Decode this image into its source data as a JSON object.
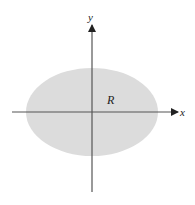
{
  "diagram": {
    "type": "region-in-plane",
    "axes": {
      "x_label": "x",
      "y_label": "y",
      "color": "#555555",
      "origin": {
        "x": 92,
        "y": 112
      },
      "x_axis": {
        "from": 12,
        "to": 178
      },
      "y_axis": {
        "from": 192,
        "to": 25
      }
    },
    "region": {
      "label": "R",
      "shape": "ellipse",
      "fill": "#dcdcdc",
      "center": {
        "x": 92,
        "y": 112
      },
      "rx": 66,
      "ry": 44
    }
  }
}
